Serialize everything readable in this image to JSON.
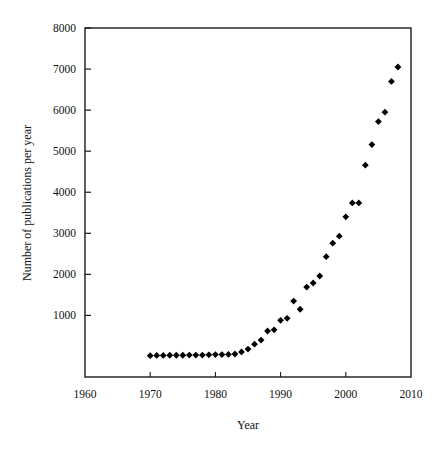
{
  "figure": {
    "background_color": "#ffffff",
    "frame_color": "#1a1a1a",
    "marker_color": "#000000",
    "marker_shape": "diamond"
  },
  "caption": {
    "cropped_text": ""
  },
  "chart_data": {
    "type": "scatter",
    "title": "",
    "xlabel": "Year",
    "ylabel": "Number of publications per year",
    "xlim": [
      1960,
      2010
    ],
    "ylim": [
      -500,
      8000
    ],
    "xticks": [
      1960,
      1970,
      1980,
      1990,
      2000,
      2010
    ],
    "xtick_labels": [
      "1960",
      "1970",
      "1980",
      "1990",
      "2000",
      "2010"
    ],
    "yticks": [
      1000,
      2000,
      3000,
      4000,
      5000,
      6000,
      7000,
      8000
    ],
    "ytick_labels": [
      "1000",
      "2000",
      "3000",
      "4000",
      "5000",
      "6000",
      "7000",
      "8000"
    ],
    "grid": false,
    "legend": null,
    "legend_position": "none",
    "x": [
      1970,
      1971,
      1972,
      1973,
      1974,
      1975,
      1976,
      1977,
      1978,
      1979,
      1980,
      1981,
      1982,
      1983,
      1984,
      1985,
      1986,
      1987,
      1988,
      1989,
      1990,
      1991,
      1992,
      1993,
      1994,
      1995,
      1996,
      1997,
      1998,
      1999,
      2000,
      2001,
      2002,
      2003,
      2004,
      2005,
      2006,
      2007,
      2008
    ],
    "values": [
      20,
      25,
      25,
      30,
      30,
      30,
      35,
      35,
      35,
      40,
      45,
      45,
      50,
      60,
      110,
      180,
      300,
      400,
      620,
      650,
      880,
      930,
      1350,
      1150,
      1690,
      1790,
      1960,
      2430,
      2760,
      2930,
      3400,
      3740,
      3740,
      4660,
      5160,
      5720,
      5950,
      6700,
      7050
    ],
    "series": [
      {
        "name": "Publications per year",
        "marker": "diamond",
        "color": "#000000",
        "values": [
          20,
          25,
          25,
          30,
          30,
          30,
          35,
          35,
          35,
          40,
          45,
          45,
          50,
          60,
          110,
          180,
          300,
          400,
          620,
          650,
          880,
          930,
          1350,
          1150,
          1690,
          1790,
          1960,
          2430,
          2760,
          2930,
          3400,
          3740,
          3740,
          4660,
          5160,
          5720,
          5950,
          6700,
          7050
        ]
      }
    ]
  }
}
